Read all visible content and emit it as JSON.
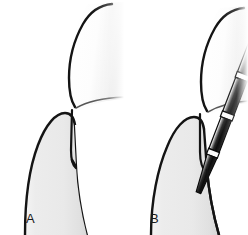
{
  "figure": {
    "background_color": "#ffffff",
    "width": 248,
    "height": 235,
    "panel_count": 2
  },
  "colors": {
    "background": "#ffffff",
    "outline": "#141414",
    "gingiva_fill_light": "#f2f2f2",
    "gingiva_fill_mid": "#e8e8e8",
    "gingiva_fill_edge": "#d2d2d2",
    "tooth_fill": "#ffffff",
    "tooth_shadow": "#e6e6e6",
    "probe_dark": "#111111",
    "probe_highlight": "#ffffff",
    "probe_band": "#fafafa",
    "label_color": "#1a1a1a"
  },
  "panels": [
    {
      "id": "a",
      "label": "A",
      "caption": "Healthy gingival sulcus in cross section",
      "structures": [
        {
          "name": "tooth-crown",
          "label": "Tooth crown"
        },
        {
          "name": "gingiva",
          "label": "Gingiva"
        },
        {
          "name": "gingival-sulcus",
          "label": "Gingival sulcus"
        },
        {
          "name": "free-gingival-margin",
          "label": "Free gingival margin"
        }
      ],
      "has_probe": false
    },
    {
      "id": "b",
      "label": "B",
      "caption": "Periodontal probe inserted into the gingival sulcus",
      "structures": [
        {
          "name": "tooth-crown",
          "label": "Tooth crown"
        },
        {
          "name": "gingiva",
          "label": "Gingiva"
        },
        {
          "name": "gingival-sulcus",
          "label": "Gingival sulcus"
        },
        {
          "name": "free-gingival-margin",
          "label": "Free gingival margin"
        },
        {
          "name": "periodontal-probe",
          "label": "Periodontal probe"
        }
      ],
      "has_probe": true,
      "probe": {
        "name": "periodontal-probe",
        "segment_count": 5,
        "band_count": 4,
        "angle_description": "Inserted from upper left, angled toward lower right",
        "tip_location": "Base of the gingival sulcus"
      }
    }
  ]
}
